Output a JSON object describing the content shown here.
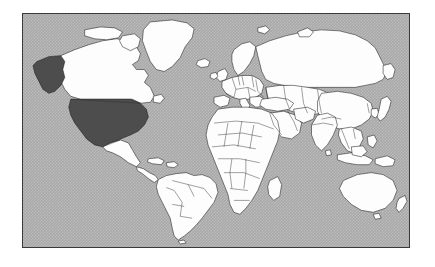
{
  "page": {
    "background_color": "#ffffff",
    "title": "World Map",
    "description": "World map with the United States highlighted"
  },
  "map": {
    "frame": {
      "border_color": "#3a3a3a",
      "x": 22,
      "y": 13,
      "width": 388,
      "height": 235
    },
    "projection": "equirectangular",
    "ocean_color": "#a9a9a9",
    "land_color": "#fdfdfd",
    "border_color": "#1c1c1c",
    "highlight_color": "#4d4d4d",
    "highlighted_regions": [
      "United States",
      "Alaska"
    ],
    "legend": {
      "highlighted_label": "Highlighted country",
      "unhighlighted_label": "Other countries",
      "ocean_label": "Ocean"
    },
    "continents": [
      "North America",
      "South America",
      "Europe",
      "Africa",
      "Asia",
      "Oceania"
    ],
    "notable_landmasses": [
      "Greenland",
      "Iceland",
      "Canada",
      "United States",
      "Alaska",
      "Mexico",
      "Brazil",
      "Argentina",
      "Chile",
      "Russia",
      "China",
      "India",
      "Japan",
      "Indonesia",
      "Australia",
      "New Zealand",
      "Madagascar",
      "United Kingdom",
      "Scandinavia",
      "Saudi Arabia",
      "Philippines",
      "Papua New Guinea",
      "Sri Lanka",
      "Cuba",
      "Svalbard"
    ]
  }
}
